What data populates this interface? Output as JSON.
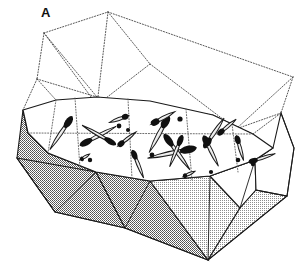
{
  "figure": {
    "panel_label": "A",
    "panel_label_position": {
      "x": 41,
      "y": 6
    },
    "caption_text": "",
    "background_color": "#ffffff",
    "line_color": "#1a1a1a",
    "dotted_line_color": "#555555",
    "shade_fill_color": "#a8a8a8",
    "light_shade_fill_color": "#c9c9c9",
    "white_fill_color": "#ffffff",
    "inclusion_fill_color": "#e8e8e8",
    "inclusion_tip_color": "#111111",
    "width": 308,
    "height": 264
  },
  "geometry": {
    "upper_transparent_body": {
      "name": "upper-transparent-prism",
      "description": "dotted outline of the transparent upper half of the block",
      "outline": "44,33 108,12 293,77 281,113 236,129 97,105 37,79",
      "edges": [
        "44,33 108,12",
        "108,12 293,77",
        "293,77 281,113",
        "281,113 236,129",
        "37,79 44,33",
        "44,33 97,105",
        "108,12 97,105",
        "108,12 150,64",
        "150,64 97,105",
        "150,64 236,129",
        "293,77 236,129",
        "37,79 23,110",
        "23,110 56,129",
        "44,33 23,110"
      ]
    },
    "plateau_surface": {
      "name": "plateau-top-surface",
      "description": "white upper surface of the lower block where the needle inclusions lie",
      "outline": "23,110 56,100 97,97 150,101 213,115 253,134 273,148 255,160 210,176 150,181 96,172 48,153 28,133"
    },
    "plateau_panel_dividers": [
      "75,99 80,168",
      "128,99 132,178",
      "186,109 192,180",
      "232,124 238,172",
      "28,133 253,134"
    ],
    "lower_solid_body": {
      "name": "lower-shaded-prism",
      "description": "gray stippled lower half of the block with faceted sides",
      "outline": "23,110 28,133 48,153 96,172 150,181 210,176 255,160 273,148 281,113 294,148 287,196 208,260 125,228 55,212 17,158",
      "facets": [
        {
          "name": "facet-left-front",
          "fill": "shade",
          "points": "23,110 17,158 55,212 96,172 48,153 28,133"
        },
        {
          "name": "facet-left-lower",
          "fill": "shade",
          "points": "17,158 55,212 125,228 96,172"
        },
        {
          "name": "facet-center-front",
          "fill": "shade",
          "points": "96,172 125,228 208,260 150,181"
        },
        {
          "name": "facet-center-right",
          "fill": "light-shade",
          "points": "150,181 208,260 240,208 210,176"
        },
        {
          "name": "facet-right-front",
          "fill": "white",
          "points": "210,176 240,208 255,190 255,160"
        },
        {
          "name": "facet-right-lower",
          "fill": "light-shade",
          "points": "240,208 208,260 287,196 255,190"
        },
        {
          "name": "facet-right-edge",
          "fill": "white",
          "points": "255,160 273,148 281,113 294,148 287,196 255,190"
        }
      ]
    }
  },
  "inclusions": {
    "description": "needle / spindle shaped crystal inclusions drawn on the plateau surface",
    "needles": [
      {
        "id": "needle-01",
        "cx": 61,
        "cy": 133,
        "length": 40,
        "width": 7,
        "angle": -56,
        "tip": "end"
      },
      {
        "id": "needle-02",
        "cx": 98,
        "cy": 136,
        "length": 41,
        "width": 7,
        "angle": -28,
        "tip": "start"
      },
      {
        "id": "needle-03",
        "cx": 99,
        "cy": 135,
        "length": 39,
        "width": 6,
        "angle": 30,
        "tip": "end"
      },
      {
        "id": "needle-04",
        "cx": 119,
        "cy": 119,
        "length": 20,
        "width": 6,
        "angle": -20,
        "tip": "end"
      },
      {
        "id": "needle-05",
        "cx": 127,
        "cy": 139,
        "length": 23,
        "width": 6,
        "angle": -38,
        "tip": "start"
      },
      {
        "id": "needle-06",
        "cx": 159,
        "cy": 134,
        "length": 42,
        "width": 8,
        "angle": -62,
        "tip": "end"
      },
      {
        "id": "needle-07",
        "cx": 163,
        "cy": 118,
        "length": 27,
        "width": 7,
        "angle": -28,
        "tip": "start"
      },
      {
        "id": "needle-08",
        "cx": 172,
        "cy": 153,
        "length": 50,
        "width": 8,
        "angle": -12,
        "tip": "end"
      },
      {
        "id": "needle-09",
        "cx": 177,
        "cy": 152,
        "length": 44,
        "width": 7,
        "angle": 54,
        "tip": "start"
      },
      {
        "id": "needle-10",
        "cx": 176,
        "cy": 151,
        "length": 34,
        "width": 6,
        "angle": -68,
        "tip": "end"
      },
      {
        "id": "needle-11",
        "cx": 138,
        "cy": 164,
        "length": 30,
        "width": 6,
        "angle": 68,
        "tip": "start"
      },
      {
        "id": "needle-12",
        "cx": 214,
        "cy": 133,
        "length": 36,
        "width": 7,
        "angle": -56,
        "tip": "start"
      },
      {
        "id": "needle-13",
        "cx": 211,
        "cy": 151,
        "length": 34,
        "width": 7,
        "angle": 64,
        "tip": "start"
      },
      {
        "id": "needle-14",
        "cx": 227,
        "cy": 127,
        "length": 24,
        "width": 6,
        "angle": -40,
        "tip": "start"
      },
      {
        "id": "needle-15",
        "cx": 240,
        "cy": 148,
        "length": 26,
        "width": 6,
        "angle": 74,
        "tip": "start"
      },
      {
        "id": "needle-16",
        "cx": 262,
        "cy": 158,
        "length": 28,
        "width": 6,
        "angle": -18,
        "tip": "start"
      },
      {
        "id": "needle-17",
        "cx": 85,
        "cy": 157,
        "length": 11,
        "width": 5,
        "angle": -32,
        "tip": "start"
      },
      {
        "id": "needle-18",
        "cx": 189,
        "cy": 174,
        "length": 13,
        "width": 5,
        "angle": -24,
        "tip": "start"
      }
    ],
    "dots": [
      {
        "id": "dot-01",
        "cx": 119,
        "cy": 126,
        "r": 2.4
      },
      {
        "id": "dot-02",
        "cx": 180,
        "cy": 119,
        "r": 2.6
      },
      {
        "id": "dot-03",
        "cx": 152,
        "cy": 155,
        "r": 2.4
      },
      {
        "id": "dot-04",
        "cx": 128,
        "cy": 130,
        "r": 2.0
      },
      {
        "id": "dot-05",
        "cx": 90,
        "cy": 160,
        "r": 2.2
      },
      {
        "id": "dot-06",
        "cx": 238,
        "cy": 160,
        "r": 2.3
      },
      {
        "id": "dot-07",
        "cx": 253,
        "cy": 164,
        "r": 2.2
      },
      {
        "id": "dot-08",
        "cx": 211,
        "cy": 172,
        "r": 2.1
      }
    ]
  }
}
